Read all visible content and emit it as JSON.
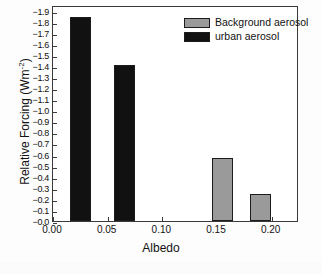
{
  "chart_data": {
    "type": "bar",
    "title": "",
    "xlabel": "Albedo",
    "ylabel": "Relative Forcing (Wm⁻²)",
    "ylabel_main": "Relative Forcing (Wm",
    "ylabel_sup": "-2",
    "ylabel_tail": ")",
    "x": [
      0.025,
      0.065,
      0.155,
      0.19
    ],
    "values": [
      -1.84,
      -1.41,
      -0.57,
      -0.24
    ],
    "bar_series": [
      "urban aerosol",
      "urban aerosol",
      "Background aerosol",
      "Background aerosol"
    ],
    "xlim": [
      0.0,
      0.225
    ],
    "ylim": [
      0.0,
      -1.95
    ],
    "xticks": [
      0.0,
      0.05,
      0.1,
      0.15,
      0.2
    ],
    "xtick_labels": [
      "0.00",
      "0.05",
      "0.10",
      "0.15",
      "0.20"
    ],
    "yticks": [
      -0.0,
      -0.1,
      -0.2,
      -0.3,
      -0.4,
      -0.5,
      -0.6,
      -0.7,
      -0.8,
      -0.9,
      -1.0,
      -1.1,
      -1.2,
      -1.3,
      -1.4,
      -1.5,
      -1.6,
      -1.7,
      -1.8,
      -1.9
    ],
    "ytick_labels": [
      "−0.0",
      "−0.1",
      "−0.2",
      "−0.3",
      "−0.4",
      "−0.5",
      "−0.6",
      "−0.7",
      "−0.8",
      "−0.9",
      "−1.0",
      "−1.1",
      "−1.2",
      "−1.3",
      "−1.4",
      "−1.5",
      "−1.6",
      "−1.7",
      "−1.8",
      "−1.9"
    ],
    "grid": false,
    "legend_position": "top-right",
    "legend": [
      {
        "label": "Background aerosol",
        "color": "#9a9a9a"
      },
      {
        "label": "urban aerosol",
        "color": "#111111"
      }
    ],
    "colors": {
      "background_aerosol": "#9a9a9a",
      "urban_aerosol": "#111111",
      "axis": "#3a3a3a",
      "text": "#111111",
      "plot_background": "#ffffff"
    },
    "bars": [
      {
        "x": 0.025,
        "value": -1.84,
        "series": "urban aerosol",
        "color": "#111111"
      },
      {
        "x": 0.065,
        "value": -1.41,
        "series": "urban aerosol",
        "color": "#111111"
      },
      {
        "x": 0.155,
        "value": -0.57,
        "series": "Background aerosol",
        "color": "#9a9a9a"
      },
      {
        "x": 0.19,
        "value": -0.24,
        "series": "Background aerosol",
        "color": "#9a9a9a"
      }
    ]
  }
}
